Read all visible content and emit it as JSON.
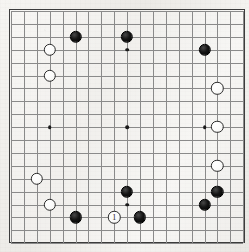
{
  "diagram": {
    "board_size": 19,
    "board_geometry": {
      "origin_x": 2,
      "origin_y": 2,
      "spacing": 12.9,
      "frame_width": 236,
      "frame_height": 234
    },
    "colors": {
      "paper": "#f2f1ee",
      "grid_line": "#8a8a8a",
      "border": "#3c3c3c",
      "black_stone": "#121212",
      "white_stone": "#ffffff",
      "white_stone_outline": "#2e2e2e",
      "star_point": "#1a1a1a"
    },
    "star_points": [
      {
        "col": 3,
        "row": 3
      },
      {
        "col": 9,
        "row": 3
      },
      {
        "col": 15,
        "row": 3
      },
      {
        "col": 3,
        "row": 9
      },
      {
        "col": 9,
        "row": 9
      },
      {
        "col": 15,
        "row": 9
      },
      {
        "col": 3,
        "row": 15
      },
      {
        "col": 9,
        "row": 15
      },
      {
        "col": 15,
        "row": 15
      }
    ],
    "stones": [
      {
        "id": "b-f17",
        "color": "black",
        "col": 5,
        "row": 2,
        "label": ""
      },
      {
        "id": "b-k17",
        "color": "black",
        "col": 9,
        "row": 2,
        "label": ""
      },
      {
        "id": "b-q16",
        "color": "black",
        "col": 15,
        "row": 3,
        "label": ""
      },
      {
        "id": "w-d16",
        "color": "white",
        "col": 3,
        "row": 3,
        "label": ""
      },
      {
        "id": "w-d14",
        "color": "white",
        "col": 3,
        "row": 5,
        "label": ""
      },
      {
        "id": "w-r13",
        "color": "white",
        "col": 16,
        "row": 6,
        "label": ""
      },
      {
        "id": "w-r10",
        "color": "white",
        "col": 16,
        "row": 9,
        "label": ""
      },
      {
        "id": "w-r7",
        "color": "white",
        "col": 16,
        "row": 12,
        "label": ""
      },
      {
        "id": "w-c7",
        "color": "white",
        "col": 2,
        "row": 13,
        "label": ""
      },
      {
        "id": "w-d5",
        "color": "white",
        "col": 3,
        "row": 15,
        "label": ""
      },
      {
        "id": "b-k5",
        "color": "black",
        "col": 9,
        "row": 14,
        "label": ""
      },
      {
        "id": "b-r5",
        "color": "black",
        "col": 16,
        "row": 14,
        "label": ""
      },
      {
        "id": "b-q4",
        "color": "black",
        "col": 15,
        "row": 15,
        "label": ""
      },
      {
        "id": "b-f3",
        "color": "black",
        "col": 5,
        "row": 16,
        "label": ""
      },
      {
        "id": "b-l3",
        "color": "black",
        "col": 10,
        "row": 16,
        "label": ""
      },
      {
        "id": "w-move-1",
        "color": "white",
        "col": 8,
        "row": 16,
        "label": "1"
      }
    ],
    "move_number": "1"
  }
}
